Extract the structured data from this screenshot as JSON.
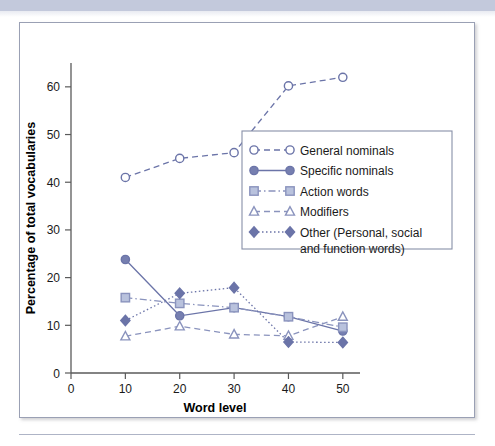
{
  "figure": {
    "border_color": "#9aa0b4",
    "band_color": "#c3c9dc"
  },
  "chart_data": {
    "type": "line",
    "title": "",
    "xlabel": "Word level",
    "ylabel": "Percentage of total vocabularies",
    "x": [
      10,
      20,
      30,
      40,
      50
    ],
    "xlim": [
      0,
      55
    ],
    "ylim": [
      0,
      65
    ],
    "xticks": [
      0,
      10,
      20,
      30,
      40,
      50
    ],
    "yticks": [
      0,
      10,
      20,
      30,
      40,
      50,
      60
    ],
    "grid": false,
    "legend_position": "center-right",
    "series": [
      {
        "name": "General nominals",
        "values": [
          41,
          45,
          46.2,
          60.2,
          62
        ],
        "marker": "circle-open",
        "linestyle": "dashed",
        "color": "#6b74a8",
        "fill": "#ffffff"
      },
      {
        "name": "Specific nominals",
        "values": [
          23.8,
          12,
          13.7,
          11.8,
          8.8
        ],
        "marker": "circle-filled",
        "linestyle": "solid",
        "color": "#6b74a8",
        "fill": "#767fb0"
      },
      {
        "name": "Action words",
        "values": [
          15.8,
          14.6,
          13.7,
          11.8,
          9.6
        ],
        "marker": "square-filled",
        "linestyle": "dashdot",
        "color": "#8a93bd",
        "fill": "#b9c2dd"
      },
      {
        "name": "Modifiers",
        "values": [
          7.7,
          9.8,
          8.1,
          7.8,
          11.8
        ],
        "marker": "triangle-open",
        "linestyle": "dashed",
        "color": "#8a93bd",
        "fill": "#ffffff"
      },
      {
        "name": "Other (Personal, social and function words)",
        "legend_line_1": "Other (Personal, social",
        "legend_line_2": "and function words)",
        "values": [
          11,
          16.7,
          17.9,
          6.5,
          6.4
        ],
        "marker": "diamond-filled",
        "linestyle": "dotted",
        "color": "#6b74a8",
        "fill": "#6b74a8"
      }
    ]
  },
  "axis": {
    "x_tick_labels": [
      "0",
      "10",
      "20",
      "30",
      "40",
      "50"
    ],
    "y_tick_labels": [
      "0",
      "10",
      "20",
      "30",
      "40",
      "50",
      "60"
    ],
    "x_title": "Word level",
    "y_title": "Percentage of total vocabularies"
  }
}
